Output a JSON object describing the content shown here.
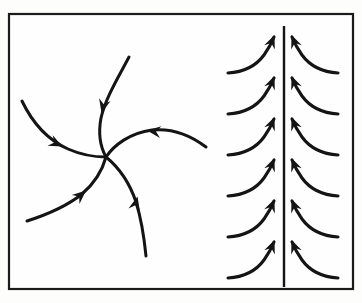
{
  "figure": {
    "background_color": "#fdfdfc",
    "ink_color": "#141414",
    "frame": {
      "x": 9,
      "y": 14,
      "width": 344,
      "height": 275,
      "stroke_width": 2.2
    }
  },
  "panels": [
    {
      "id": "spiral-panel",
      "name": "stable-focus-spiral",
      "center": {
        "x": 106,
        "y": 157
      },
      "arm_count": 5,
      "flow_direction": "inward",
      "arms": [
        {
          "id": "arm-top",
          "label": "top-arm-inflow",
          "path": "M 129 57 C 118 78 106 97 101 118 C 98 134 101 148 106 157",
          "arrow": {
            "x": 101.5,
            "y": 113,
            "angle": 104
          }
        },
        {
          "id": "arm-left",
          "label": "left-arm-inflow",
          "path": "M 22 101 C 33 124 48 140 68 149 C 84 156 97 157 106 157",
          "arrow": {
            "x": 62.5,
            "y": 146.5,
            "angle": 26
          }
        },
        {
          "id": "arm-right",
          "label": "right-arm-inflow",
          "path": "M 206 147 C 189 134 172 128 152 130 C 130 133 114 145 106 157",
          "arrow": {
            "x": 147,
            "y": 130.5,
            "angle": 187
          }
        },
        {
          "id": "arm-bottom-left",
          "label": "bottom-left-arm-inflow",
          "path": "M 27 221 C 49 214 67 206 82 194 C 96 182 103 168 106 157",
          "arrow": {
            "x": 86,
            "y": 190.5,
            "angle": -41
          }
        },
        {
          "id": "arm-bottom",
          "label": "bottom-arm-inflow",
          "path": "M 146 256 C 144 236 141 218 136 202 C 129 181 117 166 106 157",
          "arrow": {
            "x": 137.5,
            "y": 196.5,
            "angle": -76
          }
        }
      ]
    },
    {
      "id": "separatrix-panel",
      "name": "attracting-vertical-line",
      "separatrix": {
        "x": 284,
        "y_top": 26,
        "y_bottom": 287,
        "stroke_width": 2.4
      },
      "left_curve_count": 6,
      "right_curve_count": 6,
      "flow_direction": "upward-toward-line",
      "left_curves": [
        {
          "id": "L1",
          "path": "M 228 73 C 244 72 256 66 264 55 C 269 48 272 42 274 37",
          "arrow": {
            "x": 274.5,
            "y": 35,
            "angle": -68
          }
        },
        {
          "id": "L2",
          "path": "M 228 114 C 244 113 256 107 264 96 C 269 89 272 83 274 78",
          "arrow": {
            "x": 274.5,
            "y": 76,
            "angle": -68
          }
        },
        {
          "id": "L3",
          "path": "M 228 155 C 244 154 256 148 264 137 C 269 130 272 124 274 119",
          "arrow": {
            "x": 274.5,
            "y": 117,
            "angle": -68
          }
        },
        {
          "id": "L4",
          "path": "M 228 196 C 244 195 256 189 264 178 C 269 171 272 165 274 160",
          "arrow": {
            "x": 274.5,
            "y": 158,
            "angle": -68
          }
        },
        {
          "id": "L5",
          "path": "M 228 237 C 244 236 256 230 264 219 C 269 212 272 206 274 201",
          "arrow": {
            "x": 274.5,
            "y": 199,
            "angle": -68
          }
        },
        {
          "id": "L6",
          "path": "M 228 278 C 244 277 256 271 264 260 C 269 253 272 247 274 242",
          "arrow": {
            "x": 274.5,
            "y": 240,
            "angle": -68
          }
        }
      ],
      "right_curves": [
        {
          "id": "R1",
          "path": "M 338 73 C 322 72 310 66 302 55 C 297 48 294 42 292 37",
          "arrow": {
            "x": 291.5,
            "y": 35,
            "angle": -112
          }
        },
        {
          "id": "R2",
          "path": "M 338 114 C 322 113 310 107 302 96 C 297 89 294 83 292 78",
          "arrow": {
            "x": 291.5,
            "y": 76,
            "angle": -112
          }
        },
        {
          "id": "R3",
          "path": "M 338 155 C 322 154 310 148 302 137 C 297 130 294 124 292 119",
          "arrow": {
            "x": 291.5,
            "y": 117,
            "angle": -112
          }
        },
        {
          "id": "R4",
          "path": "M 338 196 C 322 195 310 189 302 178 C 297 171 294 165 292 160",
          "arrow": {
            "x": 291.5,
            "y": 158,
            "angle": -112
          }
        },
        {
          "id": "R5",
          "path": "M 338 237 C 322 236 310 230 302 219 C 297 212 294 206 292 201",
          "arrow": {
            "x": 291.5,
            "y": 199,
            "angle": -112
          }
        },
        {
          "id": "R6",
          "path": "M 338 278 C 322 277 310 271 302 260 C 297 253 294 247 292 242",
          "arrow": {
            "x": 291.5,
            "y": 240,
            "angle": -112
          }
        }
      ]
    }
  ]
}
